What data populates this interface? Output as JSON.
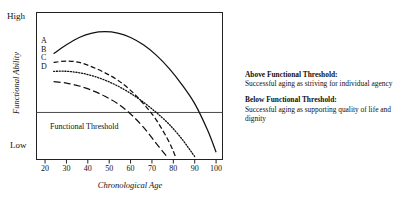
{
  "chart_data": {
    "type": "line",
    "title": "",
    "xlabel": "Chronological Age",
    "ylabel": "Functional Ability",
    "xlim": [
      16,
      103
    ],
    "ylim": [
      0,
      100
    ],
    "xticks": [
      20,
      30,
      40,
      50,
      60,
      70,
      80,
      90,
      100
    ],
    "ytick_labels": [
      "High",
      "Low"
    ],
    "grid": false,
    "legend_position": "inline-left",
    "threshold": {
      "label": "Functional Threshold",
      "value": 32
    },
    "series": [
      {
        "name": "A",
        "style": "solid",
        "x": [
          24,
          30,
          36,
          42,
          48,
          54,
          60,
          66,
          72,
          78,
          84,
          90,
          96,
          100
        ],
        "y": [
          72,
          78,
          83,
          86,
          87,
          86,
          83,
          78,
          71,
          62,
          51,
          38,
          20,
          5
        ]
      },
      {
        "name": "B",
        "style": "dashed",
        "x": [
          24,
          30,
          36,
          42,
          48,
          54,
          60,
          66,
          72,
          78,
          81
        ],
        "y": [
          66,
          67,
          66,
          63,
          59,
          54,
          47,
          38,
          27,
          12,
          2
        ]
      },
      {
        "name": "C",
        "style": "dotted",
        "x": [
          24,
          30,
          36,
          42,
          48,
          54,
          60,
          66,
          72,
          78,
          84,
          90
        ],
        "y": [
          60,
          60,
          59,
          57,
          54,
          50,
          45,
          39,
          32,
          24,
          14,
          2
        ]
      },
      {
        "name": "D",
        "style": "long-dash",
        "x": [
          24,
          30,
          36,
          42,
          48,
          54,
          60,
          66,
          72,
          77
        ],
        "y": [
          53,
          52,
          50,
          47,
          43,
          38,
          31,
          22,
          11,
          2
        ]
      }
    ],
    "series_keys": [
      "A",
      "B",
      "C",
      "D"
    ]
  },
  "notes": [
    {
      "heading": "Above Functional Threshold:",
      "body": "Successful aging as striving for individual agency"
    },
    {
      "heading": "Below Functional Threshold:",
      "body": "Successful aging as supporting quality of life and dignity"
    }
  ],
  "axis": {
    "high_label": "High",
    "low_label": "Low"
  }
}
